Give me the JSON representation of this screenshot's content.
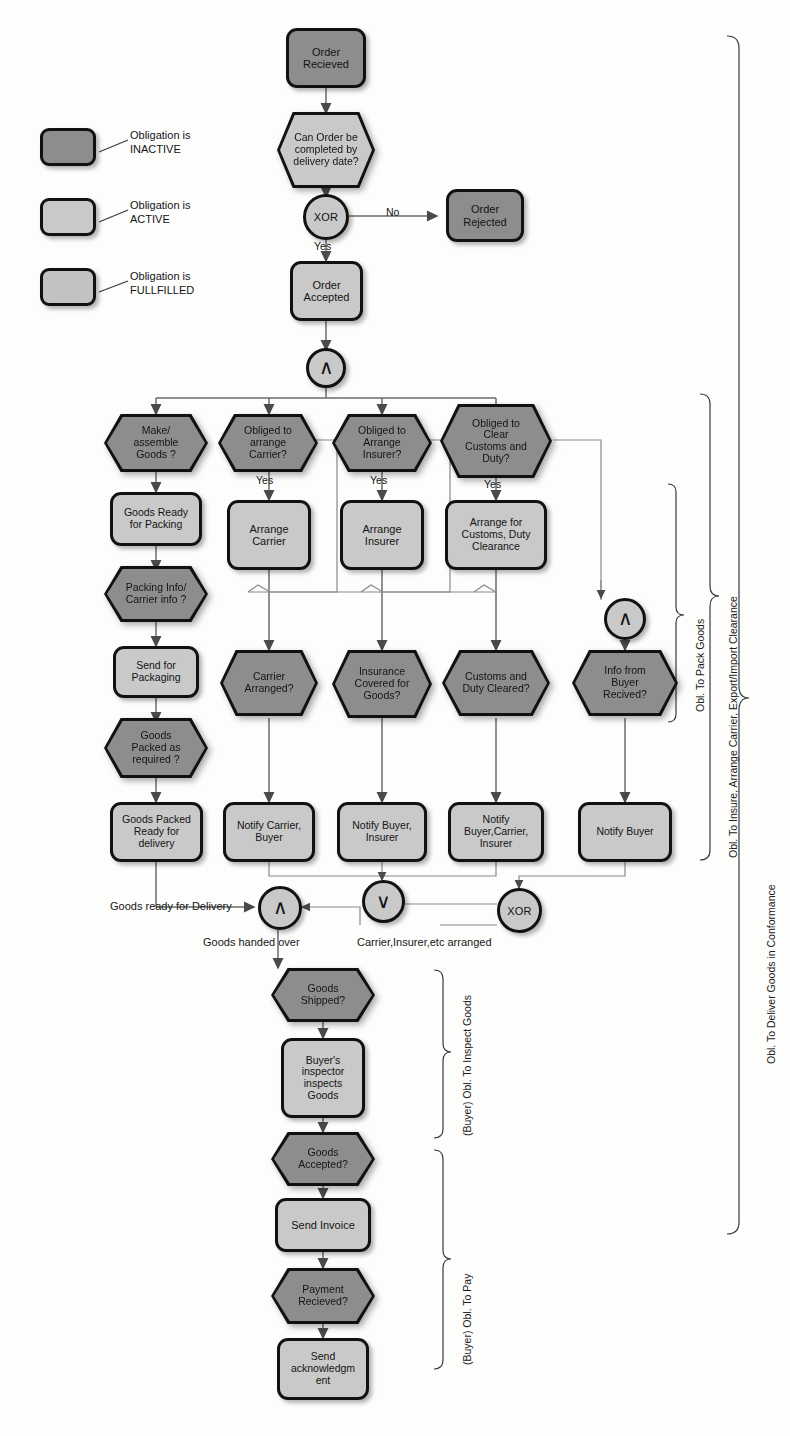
{
  "diagram": {
    "colors": {
      "inactive": "#8d8d8d",
      "active": "#c9c9c9",
      "fulfilled": "#c2c2c2",
      "stroke": "#111111",
      "background": "#fdfdfc"
    }
  },
  "legend": {
    "items": [
      {
        "state": "inactive",
        "line1": "Obligation is",
        "line2": "INACTIVE"
      },
      {
        "state": "active",
        "line1": "Obligation  is",
        "line2": "ACTIVE"
      },
      {
        "state": "fulfilled",
        "line1": "Obligation is",
        "line2": "FULLFILLED"
      }
    ]
  },
  "nodes": {
    "order_recieved": {
      "label": "Order\nRecieved",
      "shape": "rect",
      "state": "inactive"
    },
    "can_order_completed": {
      "label": "Can Order be\ncompleted by\ndelivery date?",
      "shape": "hex",
      "state": "active"
    },
    "order_rejected": {
      "label": "Order\nRejected",
      "shape": "rect",
      "state": "inactive"
    },
    "order_accepted": {
      "label": "Order\nAccepted",
      "shape": "rect",
      "state": "active"
    },
    "make_assemble_goods": {
      "label": "Make/\nassemble\nGoods ?",
      "shape": "hex",
      "state": "inactive"
    },
    "goods_ready_packing": {
      "label": "Goods Ready\nfor Packing",
      "shape": "rect",
      "state": "active"
    },
    "packing_carrier_info": {
      "label": "Packing Info/\nCarrier info ?",
      "shape": "hex",
      "state": "inactive"
    },
    "send_for_packaging": {
      "label": "Send for\nPackaging",
      "shape": "rect",
      "state": "active"
    },
    "goods_packed_required": {
      "label": "Goods\nPacked as\nrequired ?",
      "shape": "hex",
      "state": "inactive"
    },
    "goods_packed_ready": {
      "label": "Goods Packed\nReady for\ndelivery",
      "shape": "rect",
      "state": "active"
    },
    "obliged_arrange_carrier": {
      "label": "Obliged to\narrange\nCarrier?",
      "shape": "hex",
      "state": "inactive"
    },
    "arrange_carrier": {
      "label": "Arrange\nCarrier",
      "shape": "rect",
      "state": "active"
    },
    "carrier_arranged": {
      "label": "Carrier\nArranged?",
      "shape": "hex",
      "state": "inactive"
    },
    "notify_carrier_buyer": {
      "label": "Notify Carrier,\nBuyer",
      "shape": "rect",
      "state": "active"
    },
    "obliged_arrange_insurer": {
      "label": "Obliged to\nArrange\nInsurer?",
      "shape": "hex",
      "state": "inactive"
    },
    "arrange_insurer": {
      "label": "Arrange\nInsurer",
      "shape": "rect",
      "state": "active"
    },
    "insurance_covered": {
      "label": "Insurance\nCovered for\nGoods?",
      "shape": "hex",
      "state": "inactive"
    },
    "notify_buyer_insurer": {
      "label": "Notify Buyer,\nInsurer",
      "shape": "rect",
      "state": "active"
    },
    "obliged_clear_customs": {
      "label": "Obliged to\nClear\nCustoms and\nDuty?",
      "shape": "hex",
      "state": "inactive"
    },
    "arrange_customs": {
      "label": "Arrange for\nCustoms, Duty\nClearance",
      "shape": "rect",
      "state": "active"
    },
    "customs_duty_cleared": {
      "label": "Customs and\nDuty Cleared?",
      "shape": "hex",
      "state": "inactive"
    },
    "notify_buyer_carrier_insurer": {
      "label": "Notify\nBuyer,Carrier,\nInsurer",
      "shape": "rect",
      "state": "active"
    },
    "info_from_buyer": {
      "label": "Info from\nBuyer\nRecived?",
      "shape": "hex",
      "state": "inactive"
    },
    "notify_buyer": {
      "label": "Notify Buyer",
      "shape": "rect",
      "state": "active"
    },
    "goods_shipped": {
      "label": "Goods\nShipped?",
      "shape": "hex",
      "state": "inactive"
    },
    "buyers_inspector": {
      "label": "Buyer's\ninspector\ninspects\nGoods",
      "shape": "rect",
      "state": "active"
    },
    "goods_accepted": {
      "label": "Goods\nAccepted?",
      "shape": "hex",
      "state": "inactive"
    },
    "send_invoice": {
      "label": "Send Invoice",
      "shape": "rect",
      "state": "active"
    },
    "payment_recieved": {
      "label": "Payment\nRecieved?",
      "shape": "hex",
      "state": "inactive"
    },
    "send_acknowledgment": {
      "label": "Send\nacknowledgm\nent",
      "shape": "rect",
      "state": "active"
    }
  },
  "gates": {
    "xor_top": {
      "label": "XOR",
      "kind": "xor"
    },
    "and_split": {
      "label": "∧",
      "kind": "and"
    },
    "and_right": {
      "label": "∧",
      "kind": "and"
    },
    "or_join": {
      "label": "∨",
      "kind": "or"
    },
    "xor_join": {
      "label": "XOR",
      "kind": "xor"
    },
    "and_join": {
      "label": "∧",
      "kind": "and"
    }
  },
  "edge_labels": {
    "no": "No",
    "yes_top": "Yes",
    "yes_carrier": "Yes",
    "yes_insurer": "Yes",
    "yes_customs": "Yes"
  },
  "flow_labels": {
    "goods_ready_delivery": "Goods ready for Delivery",
    "carrier_insurer_arranged": "Carrier,Insurer,etc arranged",
    "goods_handed_over": "Goods handed over"
  },
  "brackets": {
    "pack_goods": "Obl. To Pack Goods",
    "insure_carrier": "Obl. To Insure, Arrange Carrier, Export/Import Clearance",
    "deliver_conform": "Obl. To Deliver Goods in Conformance",
    "inspect_goods": "(Buyer) Obl. To Inspect Goods",
    "pay": "(Buyer) Obl. To Pay"
  }
}
